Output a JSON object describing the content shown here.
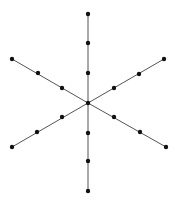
{
  "diagram": {
    "type": "star-graph",
    "center": [
      88,
      103
    ],
    "line_color": "#555555",
    "node_color": "#111111",
    "arms": [
      {
        "name": "up",
        "nodes": [
          [
            88,
            73
          ],
          [
            88,
            43
          ],
          [
            88,
            14
          ]
        ]
      },
      {
        "name": "down",
        "nodes": [
          [
            88,
            133
          ],
          [
            88,
            161
          ],
          [
            88,
            191
          ]
        ]
      },
      {
        "name": "upper-left",
        "nodes": [
          [
            62,
            88
          ],
          [
            38,
            73
          ],
          [
            12,
            59
          ]
        ]
      },
      {
        "name": "upper-right",
        "nodes": [
          [
            114,
            88
          ],
          [
            139,
            74
          ],
          [
            164,
            59
          ]
        ]
      },
      {
        "name": "lower-left",
        "nodes": [
          [
            62,
            117
          ],
          [
            37,
            132
          ],
          [
            12,
            147
          ]
        ]
      },
      {
        "name": "lower-right",
        "nodes": [
          [
            114,
            117
          ],
          [
            140,
            132
          ],
          [
            166,
            147
          ]
        ]
      }
    ]
  }
}
